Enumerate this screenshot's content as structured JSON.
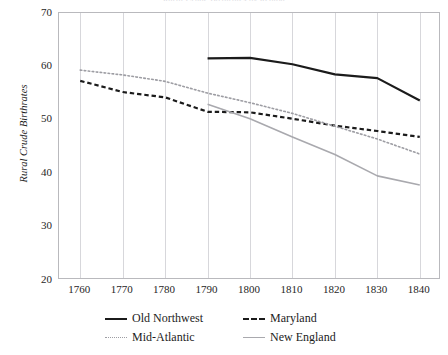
{
  "chart_data": {
    "type": "line",
    "title": "Rural Crude Birthrates by Region",
    "xlabel": "",
    "ylabel": "Rural Crude Birthrates",
    "x": [
      1760,
      1770,
      1780,
      1790,
      1800,
      1810,
      1820,
      1830,
      1840
    ],
    "xlim": [
      1755,
      1845
    ],
    "ylim": [
      20,
      70
    ],
    "xticks": [
      "1760",
      "1770",
      "1780",
      "1790",
      "1800",
      "1810",
      "1820",
      "1830",
      "1840"
    ],
    "yticks": [
      "20",
      "30",
      "40",
      "50",
      "60",
      "70"
    ],
    "grid": "vertical",
    "legend_position": "bottom",
    "series": [
      {
        "name": "Old Northwest",
        "style": "solid",
        "color": "#1b1b1b",
        "width": 2.2,
        "x": [
          1790,
          1800,
          1810,
          1820,
          1830,
          1840
        ],
        "values": [
          61.5,
          61.6,
          60.4,
          58.5,
          57.8,
          53.6
        ]
      },
      {
        "name": "Maryland",
        "style": "dashed",
        "color": "#1b1b1b",
        "width": 2.2,
        "x": [
          1760,
          1770,
          1780,
          1790,
          1800,
          1810,
          1820,
          1830,
          1840
        ],
        "values": [
          57.3,
          55.2,
          54.2,
          51.5,
          51.4,
          50.2,
          48.9,
          47.9,
          46.8
        ]
      },
      {
        "name": "Mid-Atlantic",
        "style": "dotted",
        "color": "#9d9da3",
        "width": 1.6,
        "x": [
          1760,
          1770,
          1780,
          1790,
          1800,
          1810,
          1820,
          1830,
          1840
        ],
        "values": [
          59.3,
          58.4,
          57.2,
          55.0,
          53.2,
          51.2,
          48.8,
          46.4,
          43.6
        ]
      },
      {
        "name": "New England",
        "style": "solid",
        "color": "#a9a9ae",
        "width": 1.6,
        "x": [
          1790,
          1800,
          1810,
          1820,
          1830,
          1840
        ],
        "values": [
          52.9,
          50.2,
          46.8,
          43.5,
          39.5,
          37.8
        ]
      }
    ]
  },
  "legend": {
    "items": [
      {
        "label": "Old Northwest",
        "swatch": "solid-dark-line-icon"
      },
      {
        "label": "Maryland",
        "swatch": "dashed-dark-line-icon"
      },
      {
        "label": "Mid-Atlantic",
        "swatch": "dotted-gray-line-icon"
      },
      {
        "label": "New England",
        "swatch": "solid-gray-line-icon"
      }
    ]
  },
  "colors": {
    "old_northwest": "#1b1b1b",
    "maryland": "#1b1b1b",
    "mid_atlantic": "#9d9da3",
    "new_england": "#a9a9ae",
    "grid": "#d7d7db",
    "frame": "#b9b9bd",
    "text": "#1c1c1c"
  }
}
